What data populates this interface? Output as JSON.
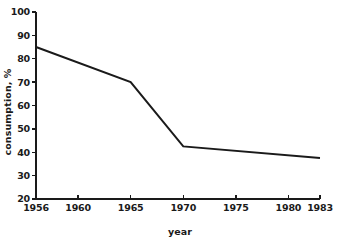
{
  "chart_data": {
    "type": "line",
    "title": "",
    "xlabel": "year",
    "ylabel": "consumption, %",
    "xlim": [
      1956,
      1983
    ],
    "ylim": [
      20,
      100
    ],
    "grid": false,
    "legend": false,
    "x": [
      1956,
      1965,
      1970,
      1983
    ],
    "values": [
      85,
      70,
      42.5,
      37.5
    ],
    "series": [
      {
        "name": "consumption",
        "color": "#1a1a1a",
        "x": [
          1956,
          1965,
          1970,
          1983
        ],
        "values": [
          85,
          70,
          42.5,
          37.5
        ]
      }
    ],
    "x_ticks": [
      1956,
      1960,
      1965,
      1970,
      1975,
      1980,
      1983
    ],
    "x_tick_labels": [
      "1956",
      "1960",
      "1965",
      "1970",
      "1975",
      "1980",
      "1983"
    ],
    "y_ticks": [
      20,
      30,
      40,
      50,
      60,
      70,
      80,
      90,
      100
    ],
    "y_tick_labels": [
      "20",
      "30",
      "40",
      "50",
      "60",
      "70",
      "80",
      "90",
      "100"
    ],
    "annotations": []
  },
  "axes": {
    "y_title": "consumption, %",
    "x_title": "year"
  },
  "colors": {
    "line": "#1a1a1a",
    "axis": "#1a1a1a",
    "background": "#ffffff"
  }
}
